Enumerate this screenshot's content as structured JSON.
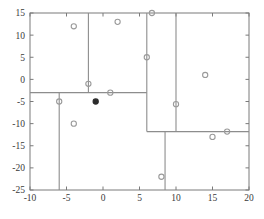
{
  "chart_data": {
    "type": "scatter",
    "title": "",
    "subtitle": "",
    "xlabel": "",
    "ylabel": "",
    "xlim": [
      -10,
      20
    ],
    "ylim": [
      -25,
      15
    ],
    "xticks": [
      -10,
      -5,
      0,
      5,
      10,
      15,
      20
    ],
    "yticks": [
      -25,
      -20,
      -15,
      -10,
      -5,
      0,
      5,
      10,
      15
    ],
    "xtick_labels": [
      "-10",
      "-5",
      "0",
      "5",
      "10",
      "15",
      "20"
    ],
    "ytick_labels": [
      "-25",
      "-20",
      "-15",
      "-10",
      "-5",
      "0",
      "5",
      "10",
      "15"
    ],
    "grid": false,
    "legend": null,
    "series": [
      {
        "name": "open-markers",
        "marker": "open-circle",
        "color": "#9a9a9a",
        "points": [
          {
            "x": -4,
            "y": 12
          },
          {
            "x": 2,
            "y": 13
          },
          {
            "x": 6.7,
            "y": 15
          },
          {
            "x": 6,
            "y": 5
          },
          {
            "x": 14,
            "y": 1
          },
          {
            "x": -2,
            "y": -1
          },
          {
            "x": 1,
            "y": -3
          },
          {
            "x": -6,
            "y": -5
          },
          {
            "x": 10,
            "y": -5.6
          },
          {
            "x": -4,
            "y": -10
          },
          {
            "x": 17,
            "y": -11.8
          },
          {
            "x": 15,
            "y": -13
          },
          {
            "x": 8,
            "y": -22
          }
        ]
      },
      {
        "name": "filled-markers",
        "marker": "filled-circle",
        "color": "#2b2b2b",
        "points": [
          {
            "x": -1,
            "y": -5
          }
        ]
      }
    ],
    "partitions": [
      {
        "orientation": "horizontal",
        "value": -3,
        "from": -10,
        "to": 6
      },
      {
        "orientation": "vertical",
        "value": -2,
        "from": -3,
        "to": 15
      },
      {
        "orientation": "vertical",
        "value": -6,
        "from": -25,
        "to": -3
      },
      {
        "orientation": "vertical",
        "value": 6,
        "from": -11.8,
        "to": 15
      },
      {
        "orientation": "vertical",
        "value": 10,
        "from": -11.8,
        "to": 15
      },
      {
        "orientation": "horizontal",
        "value": -11.8,
        "from": 6,
        "to": 20
      },
      {
        "orientation": "vertical",
        "value": 8.5,
        "from": -25,
        "to": -11.8
      }
    ]
  },
  "caption": {
    "text": ""
  }
}
